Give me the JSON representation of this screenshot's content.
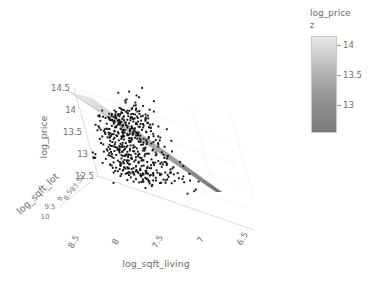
{
  "chart_data": {
    "type": "scatter",
    "title": "",
    "projection": "3d",
    "xlabel": "log_sqft_living",
    "ylabel": "log_sqft_lot",
    "zlabel": "log_price",
    "x_ticks": [
      "8.5",
      "8",
      "7.5",
      "7",
      "6.5"
    ],
    "y_ticks": [
      "7",
      "7.5",
      "8",
      "8.5",
      "9",
      "9.5",
      "10"
    ],
    "z_ticks": [
      "14.5",
      "14",
      "13.5",
      "13",
      "12.5"
    ],
    "xlim": [
      6.5,
      8.5
    ],
    "ylim": [
      7,
      10
    ],
    "zlim": [
      12.5,
      14.5
    ],
    "grid": true,
    "marker_color": "#111111",
    "surface_name": "fitted regression plane",
    "surface_colorscale": [
      "#ececec",
      "#707070"
    ],
    "points_xz": [
      [
        7.86,
        14.42
      ],
      [
        7.9,
        14.17
      ],
      [
        7.97,
        14.05
      ],
      [
        7.83,
        14.02
      ],
      [
        8.03,
        13.99
      ],
      [
        7.74,
        13.98
      ],
      [
        7.95,
        13.95
      ],
      [
        7.88,
        13.93
      ],
      [
        8.06,
        13.91
      ],
      [
        7.79,
        13.9
      ],
      [
        7.99,
        13.88
      ],
      [
        7.7,
        13.87
      ],
      [
        7.92,
        13.86
      ],
      [
        8.1,
        13.84
      ],
      [
        7.84,
        13.83
      ],
      [
        7.76,
        13.82
      ],
      [
        8.01,
        13.81
      ],
      [
        7.94,
        13.8
      ],
      [
        7.67,
        13.79
      ],
      [
        7.88,
        13.78
      ],
      [
        8.08,
        13.77
      ],
      [
        7.72,
        13.76
      ],
      [
        7.97,
        13.75
      ],
      [
        7.81,
        13.74
      ],
      [
        8.04,
        13.73
      ],
      [
        7.9,
        13.72
      ],
      [
        7.64,
        13.71
      ],
      [
        7.86,
        13.7
      ],
      [
        8.12,
        13.69
      ],
      [
        7.78,
        13.68
      ],
      [
        7.99,
        13.67
      ],
      [
        7.93,
        13.66
      ],
      [
        7.69,
        13.65
      ],
      [
        8.06,
        13.64
      ],
      [
        7.83,
        13.63
      ],
      [
        7.75,
        13.62
      ],
      [
        8.01,
        13.61
      ],
      [
        7.88,
        13.6
      ],
      [
        7.61,
        13.59
      ],
      [
        7.96,
        13.58
      ],
      [
        8.09,
        13.57
      ],
      [
        7.8,
        13.56
      ],
      [
        7.71,
        13.55
      ],
      [
        7.91,
        13.54
      ],
      [
        8.03,
        13.53
      ],
      [
        7.85,
        13.52
      ],
      [
        7.66,
        13.51
      ],
      [
        7.99,
        13.5
      ],
      [
        8.14,
        13.49
      ],
      [
        7.77,
        13.48
      ],
      [
        7.93,
        13.47
      ],
      [
        7.58,
        13.46
      ],
      [
        8.06,
        13.45
      ],
      [
        7.82,
        13.44
      ],
      [
        7.88,
        13.43
      ],
      [
        7.73,
        13.42
      ],
      [
        8.0,
        13.41
      ],
      [
        7.95,
        13.4
      ],
      [
        7.63,
        13.39
      ],
      [
        8.11,
        13.38
      ],
      [
        7.79,
        13.37
      ],
      [
        7.86,
        13.36
      ],
      [
        7.69,
        13.35
      ],
      [
        8.04,
        13.34
      ],
      [
        7.92,
        13.33
      ],
      [
        7.55,
        13.32
      ],
      [
        7.98,
        13.31
      ],
      [
        8.08,
        13.3
      ],
      [
        7.75,
        13.29
      ],
      [
        7.84,
        13.28
      ],
      [
        7.65,
        13.27
      ],
      [
        8.02,
        13.26
      ],
      [
        7.9,
        13.25
      ],
      [
        7.6,
        13.24
      ],
      [
        7.96,
        13.23
      ],
      [
        8.16,
        13.22
      ],
      [
        7.72,
        13.21
      ],
      [
        7.81,
        13.2
      ],
      [
        7.88,
        13.19
      ],
      [
        8.06,
        13.18
      ],
      [
        7.52,
        13.17
      ],
      [
        7.94,
        13.16
      ],
      [
        7.67,
        13.15
      ],
      [
        8.0,
        13.14
      ],
      [
        7.77,
        13.13
      ],
      [
        7.85,
        13.12
      ],
      [
        8.12,
        13.11
      ],
      [
        7.58,
        13.1
      ],
      [
        7.92,
        13.09
      ],
      [
        7.7,
        13.08
      ],
      [
        8.03,
        13.07
      ],
      [
        7.8,
        13.06
      ],
      [
        7.88,
        13.05
      ],
      [
        7.48,
        13.04
      ],
      [
        7.97,
        13.03
      ],
      [
        8.09,
        13.02
      ],
      [
        7.63,
        13.01
      ],
      [
        7.74,
        13.0
      ],
      [
        7.86,
        12.99
      ],
      [
        8.01,
        12.98
      ],
      [
        7.55,
        12.97
      ],
      [
        7.91,
        12.96
      ],
      [
        7.68,
        12.95
      ],
      [
        8.06,
        12.94
      ],
      [
        7.78,
        12.93
      ],
      [
        7.83,
        12.92
      ],
      [
        7.45,
        12.91
      ],
      [
        7.95,
        12.9
      ],
      [
        8.13,
        12.89
      ],
      [
        7.6,
        12.88
      ],
      [
        7.71,
        12.87
      ],
      [
        7.88,
        12.86
      ],
      [
        7.99,
        12.85
      ],
      [
        7.52,
        12.84
      ],
      [
        7.8,
        12.83
      ],
      [
        7.65,
        12.82
      ],
      [
        8.04,
        12.81
      ],
      [
        7.75,
        12.8
      ],
      [
        7.92,
        12.79
      ],
      [
        7.42,
        12.78
      ],
      [
        7.85,
        12.77
      ],
      [
        8.08,
        12.76
      ],
      [
        7.57,
        12.75
      ],
      [
        7.69,
        12.74
      ],
      [
        7.96,
        12.73
      ],
      [
        7.78,
        12.72
      ],
      [
        7.48,
        12.71
      ],
      [
        7.88,
        12.7
      ],
      [
        8.01,
        12.69
      ],
      [
        7.62,
        12.68
      ],
      [
        7.73,
        12.67
      ],
      [
        7.83,
        12.66
      ],
      [
        7.38,
        12.65
      ],
      [
        7.93,
        12.64
      ],
      [
        7.54,
        12.63
      ],
      [
        7.66,
        12.62
      ],
      [
        7.99,
        12.61
      ],
      [
        7.76,
        12.6
      ],
      [
        7.86,
        12.59
      ],
      [
        7.44,
        12.58
      ],
      [
        7.58,
        12.57
      ],
      [
        7.7,
        12.56
      ],
      [
        7.9,
        12.55
      ],
      [
        7.34,
        12.54
      ],
      [
        7.8,
        12.53
      ],
      [
        7.5,
        12.52
      ],
      [
        7.62,
        12.51
      ],
      [
        7.96,
        12.5
      ],
      [
        7.72,
        12.49
      ],
      [
        7.4,
        12.48
      ],
      [
        7.84,
        12.47
      ],
      [
        7.55,
        12.46
      ],
      [
        7.28,
        12.45
      ],
      [
        7.66,
        12.44
      ],
      [
        7.78,
        12.43
      ],
      [
        7.46,
        12.42
      ],
      [
        7.88,
        12.41
      ],
      [
        7.58,
        12.4
      ],
      [
        7.33,
        12.39
      ],
      [
        7.7,
        12.38
      ],
      [
        7.22,
        12.36
      ],
      [
        7.5,
        12.34
      ],
      [
        7.62,
        12.33
      ],
      [
        7.18,
        12.1
      ]
    ],
    "n_points": 520,
    "annotations": []
  },
  "colorbar": {
    "title": "log_price",
    "subtitle": "z",
    "ticks": [
      "14",
      "13.5",
      "13"
    ],
    "gradient_top": "#ececec",
    "gradient_bottom": "#7b7b7b"
  },
  "axes": {
    "x": {
      "title": "log_sqft_living",
      "ticks": [
        "8.5",
        "8",
        "7.5",
        "7",
        "6.5"
      ]
    },
    "y": {
      "title": "log_sqft_lot",
      "ticks": [
        "7",
        "7.5",
        "8",
        "8.5",
        "9",
        "9.5",
        "10"
      ]
    },
    "z": {
      "title": "log_price",
      "ticks": [
        "14.5",
        "14",
        "13.5",
        "13",
        "12.5"
      ]
    }
  }
}
